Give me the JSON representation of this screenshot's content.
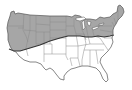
{
  "map": {
    "subject": "contiguous-united-states",
    "shaded_region": "northern-tier",
    "colors": {
      "background": "#ffffff",
      "land": "#ffffff",
      "outline": "#555555",
      "state_lines": "#8a8a8a",
      "hatch": "#777777",
      "boundary": "#333333"
    }
  }
}
